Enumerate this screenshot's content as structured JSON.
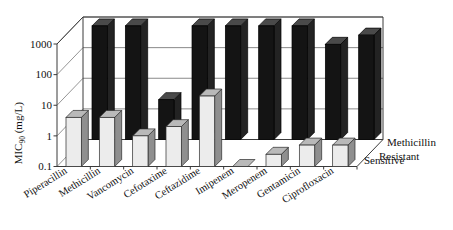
{
  "chart_data": {
    "type": "bar",
    "title": "",
    "subtitle": "",
    "xlabel": "",
    "ylabel": "MIC90 (mg/L)",
    "ylabel_main": "MIC",
    "ylabel_sub": "90",
    "ylabel_units": " (mg/L)",
    "yscale": "log",
    "ylim": [
      0.1,
      1000
    ],
    "ytick_labels": [
      "1000",
      "100",
      "10",
      "1",
      "0.1"
    ],
    "ytick_values": [
      1000,
      100,
      10,
      1,
      0.1
    ],
    "grid": true,
    "legend_position": "right-depth-axis",
    "projection": "3d",
    "categories": [
      "Piperacillin",
      "Methicillin",
      "Vancomycin",
      "Cefotaxime",
      "Ceftazidime",
      "Imipenem",
      "Meropenem",
      "Gentamicin",
      "Ciprofloxacin"
    ],
    "series": [
      {
        "name": "Methicillin Resistant",
        "legend_lines": [
          "Methicillin",
          "Resistant"
        ],
        "color": "#141414",
        "values": [
          512,
          512,
          2,
          512,
          512,
          512,
          512,
          128,
          256
        ]
      },
      {
        "name": "Sensitive",
        "legend_lines": [
          "Sensitive"
        ],
        "color": "#ececec",
        "values": [
          4,
          4,
          1,
          2,
          20,
          0.1,
          0.25,
          0.5,
          0.5
        ]
      }
    ]
  },
  "legend": {
    "items": [
      {
        "label": "Methicillin"
      },
      {
        "label": "Resistant"
      },
      {
        "label": "Sensitive"
      }
    ]
  },
  "colors": {
    "resistant": "#141414",
    "sensitive": "#ececec",
    "axis": "#3a3a3a",
    "grid": "#6b6b6b",
    "background": "#ffffff"
  }
}
